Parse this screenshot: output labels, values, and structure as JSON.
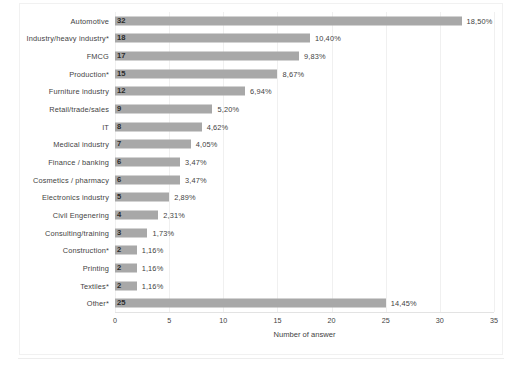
{
  "chart_data": {
    "type": "bar",
    "orientation": "horizontal",
    "title": "",
    "xlabel": "Number of answer",
    "ylabel": "",
    "xlim": [
      0,
      35
    ],
    "xticks": [
      "0",
      "5",
      "10",
      "15",
      "20",
      "25",
      "30",
      "35"
    ],
    "xtick_values": [
      0,
      5,
      10,
      15,
      20,
      25,
      30,
      35
    ],
    "grid": true,
    "grid_axis": "x",
    "legend": false,
    "bar_color": "#a8a8a8",
    "categories": [
      "Automotive",
      "Industry/heavy industry*",
      "FMCG",
      "Production*",
      "Furniture industry",
      "Retail/trade/sales",
      "IT",
      "Medical industry",
      "Finance / banking",
      "Cosmetics / pharmacy",
      "Electronics industry",
      "Civil Engenering",
      "Consulting/training",
      "Construction*",
      "Printing",
      "Textiles*",
      "Other*"
    ],
    "values": [
      32,
      18,
      17,
      15,
      12,
      9,
      8,
      7,
      6,
      6,
      5,
      4,
      3,
      2,
      2,
      2,
      25
    ],
    "value_labels": [
      "32",
      "18",
      "17",
      "15",
      "12",
      "9",
      "8",
      "7",
      "6",
      "6",
      "5",
      "4",
      "3",
      "2",
      "2",
      "2",
      "25"
    ],
    "percent_labels": [
      "18,50%",
      "10,40%",
      "9,83%",
      "8,67%",
      "6,94%",
      "5,20%",
      "4,62%",
      "4,05%",
      "3,47%",
      "3,47%",
      "2,89%",
      "2,31%",
      "1,73%",
      "1,16%",
      "1,16%",
      "1,16%",
      "14,45%"
    ],
    "percent_values": [
      18.5,
      10.4,
      9.83,
      8.67,
      6.94,
      5.2,
      4.62,
      4.05,
      3.47,
      3.47,
      2.89,
      2.31,
      1.73,
      1.16,
      1.16,
      1.16,
      14.45
    ]
  }
}
